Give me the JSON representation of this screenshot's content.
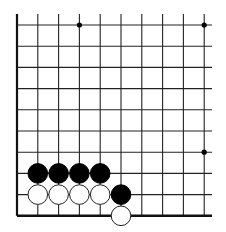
{
  "board": {
    "columns": 10,
    "rows": 10,
    "origin_x": 17,
    "origin_y": 25,
    "spacing_x": 20.8,
    "spacing_y": 21.2,
    "open_top": true,
    "open_right": true,
    "edge_left": true,
    "edge_bottom": true,
    "line_color": "#222222",
    "edge_color": "#111111",
    "background": "#ffffff"
  },
  "star_points": [
    {
      "col": 3,
      "row": 0
    },
    {
      "col": 9,
      "row": 0
    },
    {
      "col": 9,
      "row": 6
    }
  ],
  "stones": [
    {
      "color": "black",
      "col": 1,
      "row": 7
    },
    {
      "color": "black",
      "col": 2,
      "row": 7
    },
    {
      "color": "black",
      "col": 3,
      "row": 7
    },
    {
      "color": "black",
      "col": 4,
      "row": 7
    },
    {
      "color": "black",
      "col": 5,
      "row": 8
    },
    {
      "color": "white",
      "col": 1,
      "row": 8
    },
    {
      "color": "white",
      "col": 2,
      "row": 8
    },
    {
      "color": "white",
      "col": 3,
      "row": 8
    },
    {
      "color": "white",
      "col": 4,
      "row": 8
    },
    {
      "color": "white",
      "col": 5,
      "row": 9
    }
  ],
  "colors": {
    "black_stone": "#000000",
    "white_stone": "#ffffff",
    "white_stone_outline": "#222222"
  }
}
